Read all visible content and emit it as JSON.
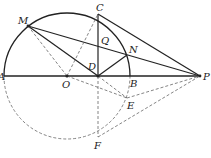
{
  "diagram": {
    "type": "geometry",
    "points": {
      "A": {
        "label": "A",
        "x": 4,
        "y": 76
      },
      "O": {
        "label": "O",
        "x": 67,
        "y": 76
      },
      "D": {
        "label": "D",
        "x": 98,
        "y": 76
      },
      "B": {
        "label": "B",
        "x": 130,
        "y": 76
      },
      "P": {
        "label": "P",
        "x": 200,
        "y": 76
      },
      "C": {
        "label": "C",
        "x": 98,
        "y": 14
      },
      "M": {
        "label": "M",
        "x": 28,
        "y": 26
      },
      "N": {
        "label": "N",
        "x": 127,
        "y": 55
      },
      "Q": {
        "label": "Q",
        "x": 98,
        "y": 42
      },
      "E": {
        "label": "E",
        "x": 127,
        "y": 98
      },
      "F": {
        "label": "F",
        "x": 98,
        "y": 137
      }
    },
    "labels": [
      "A",
      "O",
      "D",
      "B",
      "P",
      "C",
      "M",
      "N",
      "Q",
      "E",
      "F"
    ]
  }
}
